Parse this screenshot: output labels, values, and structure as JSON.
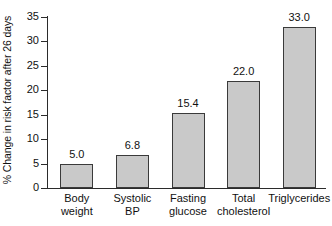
{
  "chart_data": {
    "type": "bar",
    "title": "",
    "xlabel": "",
    "ylabel": "% Change in risk factor after 26 days",
    "ylim": [
      0,
      35
    ],
    "ytick_step": 5,
    "yticks": [
      0,
      5,
      10,
      15,
      20,
      25,
      30,
      35
    ],
    "ytick_labels": [
      "0",
      "5",
      "10",
      "15",
      "20",
      "25",
      "30",
      "35"
    ],
    "grid": false,
    "legend": false,
    "bar_fill_color": "#c9c9c9",
    "bar_border_color": "#3a3a3a",
    "background_color": "#ffffff",
    "categories": [
      "Body weight",
      "Systolic BP",
      "Fasting glucose",
      "Total cholesterol",
      "Triglycerides"
    ],
    "category_lines": [
      [
        "Body",
        "weight"
      ],
      [
        "Systolic",
        "BP"
      ],
      [
        "Fasting",
        "glucose"
      ],
      [
        "Total",
        "cholesterol"
      ],
      [
        "Triglycerides",
        ""
      ]
    ],
    "values": [
      5.0,
      6.8,
      15.4,
      22.0,
      33.0
    ],
    "value_labels": [
      "5.0",
      "6.8",
      "15.4",
      "22.0",
      "33.0"
    ]
  }
}
